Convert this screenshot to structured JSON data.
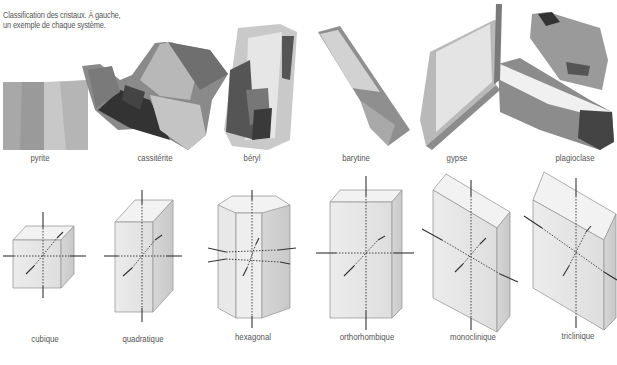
{
  "caption": {
    "line1": "Classification des cristaux. À gauche,",
    "line2": "un exemple de chaque système."
  },
  "minerals": [
    {
      "name": "pyrite",
      "x": 40,
      "y": 155
    },
    {
      "name": "cassitérite",
      "x": 155,
      "y": 155
    },
    {
      "name": "béryl",
      "x": 252,
      "y": 155
    },
    {
      "name": "barytine",
      "x": 356,
      "y": 155
    },
    {
      "name": "gypse",
      "x": 457,
      "y": 155
    },
    {
      "name": "plagioclase",
      "x": 575,
      "y": 155
    }
  ],
  "systems": [
    {
      "name": "cubique",
      "x": 45,
      "y": 336
    },
    {
      "name": "quadratique",
      "x": 143,
      "y": 336
    },
    {
      "name": "hexagonal",
      "x": 253,
      "y": 334
    },
    {
      "name": "orthorhombique",
      "x": 367,
      "y": 334
    },
    {
      "name": "monoclinique",
      "x": 473,
      "y": 334
    },
    {
      "name": "triclinique",
      "x": 578,
      "y": 333
    }
  ]
}
